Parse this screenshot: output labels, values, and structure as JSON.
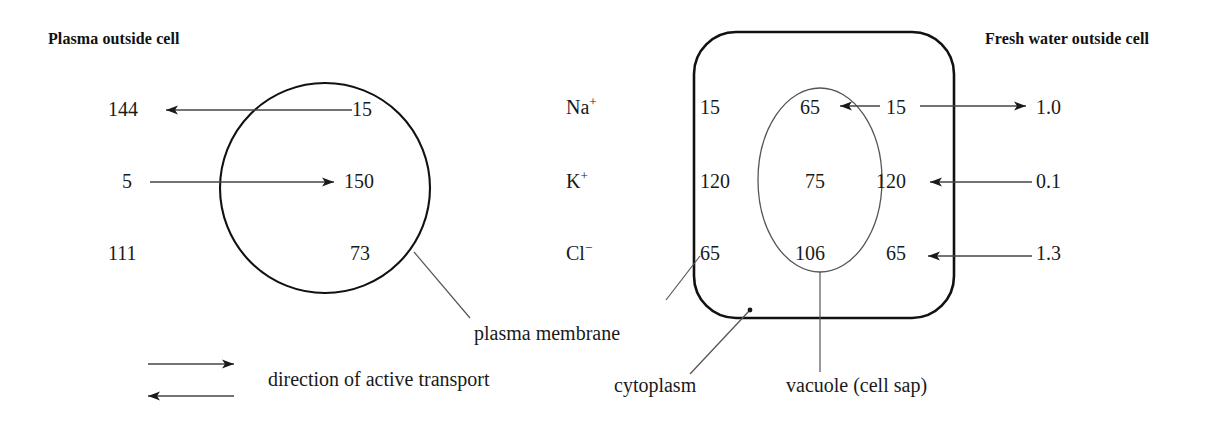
{
  "figure": {
    "left_panel": {
      "heading": "Plasma outside cell",
      "rows": [
        {
          "outside": "144",
          "inside": "15",
          "transport": "inward-passive-outward-active"
        },
        {
          "outside": "5",
          "inside": "150",
          "transport": "outward-active"
        },
        {
          "outside": "111",
          "inside": "73",
          "transport": "none"
        }
      ],
      "membrane_label": "plasma membrane"
    },
    "right_panel": {
      "heading": "Fresh water outside cell",
      "ions": [
        {
          "label": "Na",
          "charge": "+"
        },
        {
          "label": "K",
          "charge": "+"
        },
        {
          "label": "Cl",
          "charge": "−"
        }
      ],
      "cytoplasm_values": [
        "15",
        "120",
        "65"
      ],
      "vacuole_values": [
        "65",
        "75",
        "106"
      ],
      "inner_edge_values": [
        "15",
        "120",
        "65"
      ],
      "external_values": [
        "1.0",
        "0.1",
        "1.3"
      ],
      "labels": {
        "cytoplasm": "cytoplasm",
        "vacuole": "vacuole (cell sap)"
      }
    },
    "legend": {
      "text": "direction of active transport"
    },
    "colors": {
      "ink": "#1a1a1a",
      "membrane": "#111111",
      "thin_line": "#444444",
      "background": "#ffffff"
    }
  }
}
